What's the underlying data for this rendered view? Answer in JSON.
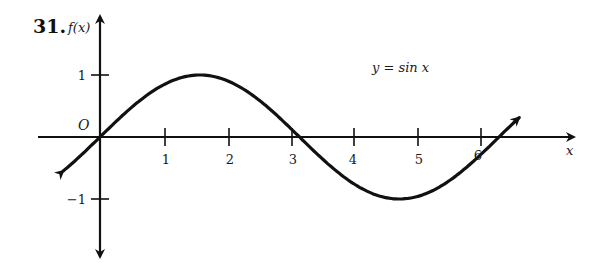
{
  "problem": {
    "number": "31."
  },
  "axes": {
    "y_label": "f(x)",
    "x_label": "x",
    "origin_label": "O",
    "x_ticks": [
      "1",
      "2",
      "3",
      "4",
      "5",
      "6"
    ],
    "y_ticks": [
      "1",
      "−1"
    ]
  },
  "equation": "y = sin x",
  "colors": {
    "stroke": "#111111",
    "background": "#ffffff"
  },
  "chart_data": {
    "type": "line",
    "title": "",
    "function": "y = sin x",
    "xlabel": "x",
    "ylabel": "f(x)",
    "xlim": [
      -0.6,
      7.4
    ],
    "ylim": [
      -1.9,
      2.0
    ],
    "x_ticks": [
      1,
      2,
      3,
      4,
      5,
      6
    ],
    "y_ticks": [
      1,
      -1
    ],
    "grid": false,
    "series": [
      {
        "name": "y = sin x",
        "x": [
          -0.6,
          0,
          0.785,
          1.571,
          2.356,
          3.142,
          3.927,
          4.712,
          5.498,
          6.283,
          6.6
        ],
        "values": [
          -0.565,
          0,
          0.707,
          1,
          0.707,
          0,
          -0.707,
          -1,
          -0.707,
          0,
          0.312
        ]
      }
    ]
  }
}
